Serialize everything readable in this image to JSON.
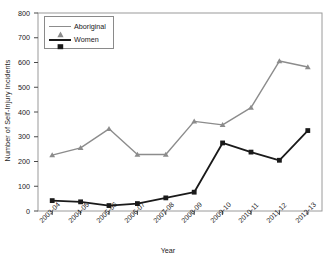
{
  "chart_data": {
    "type": "line",
    "title": "",
    "xlabel": "Year",
    "ylabel": "Number of Self-Injury Incidents",
    "categories": [
      "2003-04",
      "2004-05",
      "2005-06",
      "2006-07",
      "2007-08",
      "2008-09",
      "2009-10",
      "2010-11",
      "2011-12",
      "2012-13"
    ],
    "ylim": [
      0,
      800
    ],
    "yticks": [
      0,
      100,
      200,
      300,
      400,
      500,
      600,
      700,
      800
    ],
    "ytick_labels": [
      "0",
      "100",
      "200",
      "300",
      "400",
      "500",
      "600",
      "700",
      "800"
    ],
    "grid": false,
    "legend_position": "upper-left",
    "series": [
      {
        "name": "Aboriginal",
        "color": "#8c8c8c",
        "marker": "triangle",
        "values": [
          226,
          255,
          332,
          228,
          228,
          362,
          348,
          418,
          606,
          582
        ]
      },
      {
        "name": "Women",
        "color": "#1a1a1a",
        "marker": "square",
        "values": [
          42,
          37,
          22,
          30,
          53,
          76,
          275,
          238,
          205,
          325
        ]
      }
    ]
  },
  "legend": {
    "items": [
      {
        "label": "Aboriginal"
      },
      {
        "label": "Women"
      }
    ]
  },
  "axes": {
    "x_title": "Year",
    "y_title": "Number of Self-Injury Incidents"
  }
}
